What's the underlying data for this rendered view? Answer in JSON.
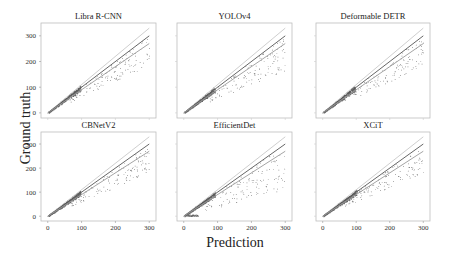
{
  "figure": {
    "xlabel": "Prediction",
    "ylabel": "Ground truth"
  },
  "chart_data": {
    "type": "scatter",
    "layout": {
      "rows": 2,
      "cols": 3,
      "grid": false,
      "legend": "none",
      "xlim": [
        -20,
        320
      ],
      "ylim": [
        -20,
        350
      ]
    },
    "xlabel": "Prediction",
    "ylabel": "Ground truth",
    "xticks": [
      0,
      100,
      200,
      300
    ],
    "yticks": [
      0,
      100,
      200,
      300
    ],
    "reference_lines": [
      {
        "name": "y = 1.1x",
        "slope": 1.1,
        "color": "#c8c8c8"
      },
      {
        "name": "y = x",
        "slope": 1.0,
        "color": "#555555"
      },
      {
        "name": "y = 0.9x",
        "slope": 0.9,
        "color": "#9a9a9a"
      }
    ],
    "panels": [
      {
        "title": "Libra R-CNN",
        "row": 0,
        "col": 0,
        "seed": 11,
        "cluster_max": 95,
        "spread_max": 300,
        "outlier_low": 0.62
      },
      {
        "title": "YOLOv4",
        "row": 0,
        "col": 1,
        "seed": 23,
        "cluster_max": 90,
        "spread_max": 300,
        "outlier_low": 0.55
      },
      {
        "title": "Deformable DETR",
        "row": 0,
        "col": 2,
        "seed": 37,
        "cluster_max": 95,
        "spread_max": 300,
        "outlier_low": 0.6
      },
      {
        "title": "CBNetV2",
        "row": 1,
        "col": 0,
        "seed": 41,
        "cluster_max": 95,
        "spread_max": 300,
        "outlier_low": 0.6
      },
      {
        "title": "EfficientDet",
        "row": 1,
        "col": 1,
        "seed": 53,
        "cluster_max": 90,
        "spread_max": 300,
        "outlier_low": 0.35
      },
      {
        "title": "XCiT",
        "row": 1,
        "col": 2,
        "seed": 67,
        "cluster_max": 100,
        "spread_max": 300,
        "outlier_low": 0.6
      }
    ]
  }
}
